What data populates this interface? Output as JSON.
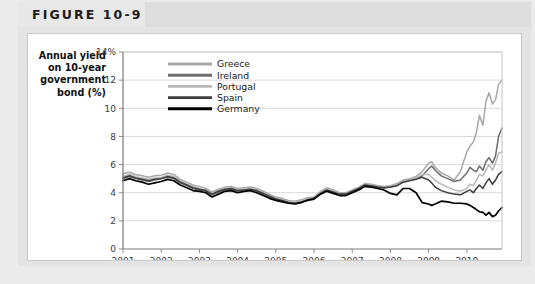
{
  "figure": {
    "title": "FIGURE 10-9",
    "tab_bg": "#e8e8e8",
    "header_bg": "#dedede",
    "card_bg": "#ffffff",
    "outer_bg": "#ebebeb"
  },
  "chart_data": {
    "type": "line",
    "title": "",
    "ylabel": "Annual yield on 10-year government bond (%)",
    "ylabel_lines": [
      "Annual yield",
      "on 10-year",
      "government",
      "bond (%)"
    ],
    "xlabel": "",
    "ylim": [
      0,
      14
    ],
    "yticks": [
      0,
      2,
      4,
      6,
      8,
      10,
      12,
      14
    ],
    "ytick_labels": [
      "0",
      "2",
      "4",
      "6",
      "8",
      "10",
      "12",
      "14%"
    ],
    "xlim": [
      2001.0,
      2010.92
    ],
    "xticks": [
      2001,
      2002,
      2003,
      2004,
      2005,
      2006,
      2007,
      2008,
      2009,
      2010
    ],
    "xtick_labels": [
      "2001",
      "2002",
      "2003",
      "2004",
      "2005",
      "2006",
      "2007",
      "2008",
      "2009",
      "2010"
    ],
    "grid": "horizontal",
    "legend_position": "top-left-inside",
    "series": [
      {
        "name": "Greece",
        "color": "#a8a8a8",
        "width": 1.5,
        "x": [
          2001.0,
          2001.17,
          2001.33,
          2001.5,
          2001.67,
          2001.83,
          2002.0,
          2002.17,
          2002.33,
          2002.5,
          2002.67,
          2002.83,
          2003.0,
          2003.17,
          2003.33,
          2003.5,
          2003.67,
          2003.83,
          2004.0,
          2004.17,
          2004.33,
          2004.5,
          2004.67,
          2004.83,
          2005.0,
          2005.17,
          2005.33,
          2005.5,
          2005.67,
          2005.83,
          2006.0,
          2006.17,
          2006.33,
          2006.5,
          2006.67,
          2006.83,
          2007.0,
          2007.17,
          2007.33,
          2007.5,
          2007.67,
          2007.83,
          2008.0,
          2008.17,
          2008.33,
          2008.5,
          2008.67,
          2008.83,
          2009.0,
          2009.08,
          2009.17,
          2009.33,
          2009.5,
          2009.67,
          2009.83,
          2010.0,
          2010.08,
          2010.17,
          2010.25,
          2010.33,
          2010.42,
          2010.5,
          2010.58,
          2010.67,
          2010.75,
          2010.83,
          2010.92
        ],
        "y": [
          5.35,
          5.45,
          5.3,
          5.2,
          5.1,
          5.2,
          5.25,
          5.4,
          5.3,
          4.95,
          4.75,
          4.55,
          4.45,
          4.3,
          4.05,
          4.25,
          4.4,
          4.45,
          4.3,
          4.35,
          4.4,
          4.3,
          4.1,
          3.9,
          3.7,
          3.6,
          3.45,
          3.4,
          3.5,
          3.65,
          3.7,
          4.1,
          4.35,
          4.2,
          4.0,
          4.0,
          4.2,
          4.4,
          4.65,
          4.6,
          4.5,
          4.45,
          4.5,
          4.65,
          4.9,
          5.0,
          5.15,
          5.5,
          6.1,
          6.2,
          5.8,
          5.4,
          5.2,
          4.9,
          5.5,
          6.9,
          7.3,
          7.6,
          8.3,
          9.5,
          8.8,
          10.5,
          11.1,
          10.3,
          10.6,
          11.7,
          12.0
        ]
      },
      {
        "name": "Ireland",
        "color": "#6e6e6e",
        "width": 1.5,
        "x": [
          2001.0,
          2001.17,
          2001.33,
          2001.5,
          2001.67,
          2001.83,
          2002.0,
          2002.17,
          2002.33,
          2002.5,
          2002.67,
          2002.83,
          2003.0,
          2003.17,
          2003.33,
          2003.5,
          2003.67,
          2003.83,
          2004.0,
          2004.17,
          2004.33,
          2004.5,
          2004.67,
          2004.83,
          2005.0,
          2005.17,
          2005.33,
          2005.5,
          2005.67,
          2005.83,
          2006.0,
          2006.17,
          2006.33,
          2006.5,
          2006.67,
          2006.83,
          2007.0,
          2007.17,
          2007.33,
          2007.5,
          2007.67,
          2007.83,
          2008.0,
          2008.17,
          2008.33,
          2008.5,
          2008.67,
          2008.83,
          2009.0,
          2009.08,
          2009.17,
          2009.33,
          2009.5,
          2009.67,
          2009.83,
          2010.0,
          2010.08,
          2010.17,
          2010.25,
          2010.33,
          2010.42,
          2010.5,
          2010.58,
          2010.67,
          2010.75,
          2010.83,
          2010.92
        ],
        "y": [
          5.0,
          5.15,
          5.0,
          4.9,
          4.8,
          4.9,
          5.0,
          5.1,
          5.0,
          4.7,
          4.5,
          4.3,
          4.2,
          4.1,
          3.85,
          4.05,
          4.2,
          4.25,
          4.1,
          4.2,
          4.25,
          4.1,
          3.9,
          3.7,
          3.5,
          3.4,
          3.3,
          3.25,
          3.35,
          3.5,
          3.6,
          3.95,
          4.2,
          4.05,
          3.9,
          3.9,
          4.1,
          4.3,
          4.55,
          4.5,
          4.4,
          4.35,
          4.4,
          4.5,
          4.75,
          4.9,
          5.0,
          5.2,
          5.7,
          5.9,
          5.6,
          5.2,
          5.0,
          4.8,
          4.9,
          5.4,
          5.8,
          5.6,
          5.5,
          5.9,
          5.6,
          6.2,
          6.5,
          6.1,
          6.6,
          8.0,
          8.6
        ]
      },
      {
        "name": "Portugal",
        "color": "#b9b9b9",
        "width": 1.5,
        "x": [
          2001.0,
          2001.17,
          2001.33,
          2001.5,
          2001.67,
          2001.83,
          2002.0,
          2002.17,
          2002.33,
          2002.5,
          2002.67,
          2002.83,
          2003.0,
          2003.17,
          2003.33,
          2003.5,
          2003.67,
          2003.83,
          2004.0,
          2004.17,
          2004.33,
          2004.5,
          2004.67,
          2004.83,
          2005.0,
          2005.17,
          2005.33,
          2005.5,
          2005.67,
          2005.83,
          2006.0,
          2006.17,
          2006.33,
          2006.5,
          2006.67,
          2006.83,
          2007.0,
          2007.17,
          2007.33,
          2007.5,
          2007.67,
          2007.83,
          2008.0,
          2008.17,
          2008.33,
          2008.5,
          2008.67,
          2008.83,
          2009.0,
          2009.08,
          2009.17,
          2009.33,
          2009.5,
          2009.67,
          2009.83,
          2010.0,
          2010.08,
          2010.17,
          2010.25,
          2010.33,
          2010.42,
          2010.5,
          2010.58,
          2010.67,
          2010.75,
          2010.83,
          2010.92
        ],
        "y": [
          5.15,
          5.3,
          5.15,
          5.05,
          4.95,
          5.05,
          5.1,
          5.25,
          5.15,
          4.85,
          4.6,
          4.45,
          4.3,
          4.2,
          3.95,
          4.15,
          4.3,
          4.35,
          4.2,
          4.25,
          4.3,
          4.2,
          4.0,
          3.8,
          3.6,
          3.5,
          3.35,
          3.3,
          3.4,
          3.55,
          3.65,
          4.0,
          4.25,
          4.1,
          3.95,
          3.95,
          4.15,
          4.35,
          4.6,
          4.55,
          4.45,
          4.4,
          4.45,
          4.55,
          4.8,
          4.9,
          5.05,
          5.3,
          5.3,
          5.1,
          4.9,
          4.6,
          4.4,
          4.2,
          4.1,
          4.3,
          4.6,
          4.5,
          4.9,
          5.3,
          5.2,
          5.6,
          6.0,
          5.6,
          6.1,
          6.8,
          6.9
        ]
      },
      {
        "name": "Spain",
        "color": "#3d3d3d",
        "width": 1.5,
        "x": [
          2001.0,
          2001.17,
          2001.33,
          2001.5,
          2001.67,
          2001.83,
          2002.0,
          2002.17,
          2002.33,
          2002.5,
          2002.67,
          2002.83,
          2003.0,
          2003.17,
          2003.33,
          2003.5,
          2003.67,
          2003.83,
          2004.0,
          2004.17,
          2004.33,
          2004.5,
          2004.67,
          2004.83,
          2005.0,
          2005.17,
          2005.33,
          2005.5,
          2005.67,
          2005.83,
          2006.0,
          2006.17,
          2006.33,
          2006.5,
          2006.67,
          2006.83,
          2007.0,
          2007.17,
          2007.33,
          2007.5,
          2007.67,
          2007.83,
          2008.0,
          2008.17,
          2008.33,
          2008.5,
          2008.67,
          2008.83,
          2009.0,
          2009.08,
          2009.17,
          2009.33,
          2009.5,
          2009.67,
          2009.83,
          2010.0,
          2010.08,
          2010.17,
          2010.25,
          2010.33,
          2010.42,
          2010.5,
          2010.58,
          2010.67,
          2010.75,
          2010.83,
          2010.92
        ],
        "y": [
          5.05,
          5.2,
          5.05,
          4.95,
          4.85,
          4.95,
          5.0,
          5.15,
          5.05,
          4.75,
          4.55,
          4.35,
          4.25,
          4.15,
          3.9,
          4.1,
          4.25,
          4.3,
          4.15,
          4.2,
          4.25,
          4.15,
          3.95,
          3.75,
          3.55,
          3.45,
          3.3,
          3.25,
          3.35,
          3.5,
          3.6,
          3.95,
          4.2,
          4.05,
          3.9,
          3.9,
          4.1,
          4.3,
          4.55,
          4.5,
          4.4,
          4.35,
          4.4,
          4.5,
          4.75,
          4.85,
          4.95,
          5.1,
          4.9,
          4.7,
          4.4,
          4.15,
          4.0,
          3.9,
          3.85,
          4.1,
          4.2,
          4.0,
          4.3,
          4.55,
          4.3,
          4.7,
          5.0,
          4.6,
          4.9,
          5.3,
          5.5
        ]
      },
      {
        "name": "Germany",
        "color": "#000000",
        "width": 1.7,
        "x": [
          2001.0,
          2001.17,
          2001.33,
          2001.5,
          2001.67,
          2001.83,
          2002.0,
          2002.17,
          2002.33,
          2002.5,
          2002.67,
          2002.83,
          2003.0,
          2003.17,
          2003.33,
          2003.5,
          2003.67,
          2003.83,
          2004.0,
          2004.17,
          2004.33,
          2004.5,
          2004.67,
          2004.83,
          2005.0,
          2005.17,
          2005.33,
          2005.5,
          2005.67,
          2005.83,
          2006.0,
          2006.17,
          2006.33,
          2006.5,
          2006.67,
          2006.83,
          2007.0,
          2007.17,
          2007.33,
          2007.5,
          2007.67,
          2007.83,
          2008.0,
          2008.17,
          2008.33,
          2008.5,
          2008.67,
          2008.83,
          2009.0,
          2009.08,
          2009.17,
          2009.33,
          2009.5,
          2009.67,
          2009.83,
          2010.0,
          2010.08,
          2010.17,
          2010.25,
          2010.33,
          2010.42,
          2010.5,
          2010.58,
          2010.67,
          2010.75,
          2010.83,
          2010.92
        ],
        "y": [
          4.85,
          5.0,
          4.85,
          4.75,
          4.6,
          4.7,
          4.8,
          4.95,
          4.85,
          4.55,
          4.35,
          4.15,
          4.1,
          4.0,
          3.7,
          3.9,
          4.1,
          4.15,
          4.0,
          4.1,
          4.15,
          4.0,
          3.8,
          3.6,
          3.45,
          3.35,
          3.25,
          3.2,
          3.3,
          3.45,
          3.55,
          3.9,
          4.1,
          3.95,
          3.8,
          3.8,
          4.0,
          4.2,
          4.45,
          4.4,
          4.3,
          4.2,
          3.95,
          3.85,
          4.3,
          4.3,
          4.0,
          3.3,
          3.2,
          3.1,
          3.2,
          3.4,
          3.35,
          3.25,
          3.25,
          3.2,
          3.1,
          2.95,
          2.8,
          2.65,
          2.6,
          2.4,
          2.6,
          2.3,
          2.4,
          2.7,
          2.95
        ]
      }
    ]
  }
}
